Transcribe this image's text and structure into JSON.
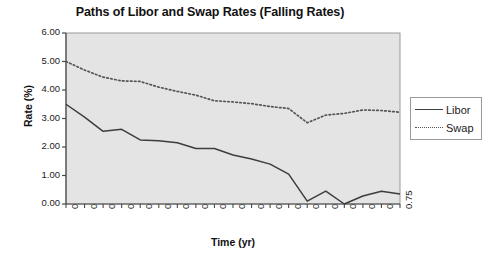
{
  "chart_data": {
    "type": "line",
    "title": "Paths of Libor and Swap Rates (Falling Rates)",
    "xlabel": "Time (yr)",
    "ylabel": "Rate (%)",
    "x": [
      0,
      0.04,
      0.08,
      0.13,
      0.17,
      0.21,
      0.25,
      0.29,
      0.33,
      0.38,
      0.42,
      0.46,
      0.5,
      0.54,
      0.58,
      0.63,
      0.67,
      0.71,
      0.75
    ],
    "xtick_labels": [
      "0",
      "0.04",
      "0.08",
      "0.13",
      "0.17",
      "0.21",
      "0.25",
      "0.29",
      "0.33",
      "0.38",
      "0.42",
      "0.46",
      "0.5",
      "0.54",
      "0.58",
      "0.63",
      "0.67",
      "0.71",
      "0.75"
    ],
    "ytick_labels": [
      "0.00",
      "1.00",
      "2.00",
      "3.00",
      "4.00",
      "5.00",
      "6.00"
    ],
    "ylim": [
      0,
      6
    ],
    "ytick_step": 1,
    "grid": false,
    "legend_position": "right-outside",
    "series": [
      {
        "name": "Libor",
        "style": "solid",
        "color": "#3d3d3d",
        "values": [
          3.5,
          3.05,
          2.55,
          2.62,
          2.25,
          2.22,
          2.15,
          1.95,
          1.95,
          1.72,
          1.58,
          1.4,
          1.05,
          0.1,
          0.45,
          0.0,
          0.28,
          0.45,
          0.35
        ]
      },
      {
        "name": "Swap",
        "style": "dotted",
        "color": "#555555",
        "values": [
          5.0,
          4.7,
          4.45,
          4.32,
          4.3,
          4.1,
          3.95,
          3.82,
          3.62,
          3.58,
          3.52,
          3.42,
          3.35,
          2.85,
          3.12,
          3.18,
          3.3,
          3.28,
          3.22
        ]
      }
    ]
  },
  "legend": {
    "items": [
      {
        "label": "Libor"
      },
      {
        "label": "Swap"
      }
    ]
  }
}
